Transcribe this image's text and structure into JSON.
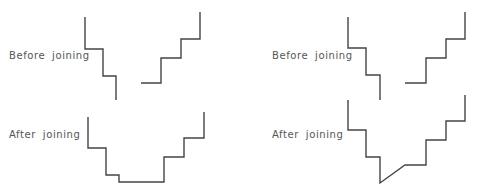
{
  "panels": [
    {
      "id": "left",
      "before_label": "Before joining",
      "after_label": "After joining"
    },
    {
      "id": "right",
      "before_label": "Before joining",
      "after_label": "After joining"
    }
  ],
  "colors": {
    "line": "#444444",
    "text": "#555555",
    "background": "#ffffff"
  }
}
